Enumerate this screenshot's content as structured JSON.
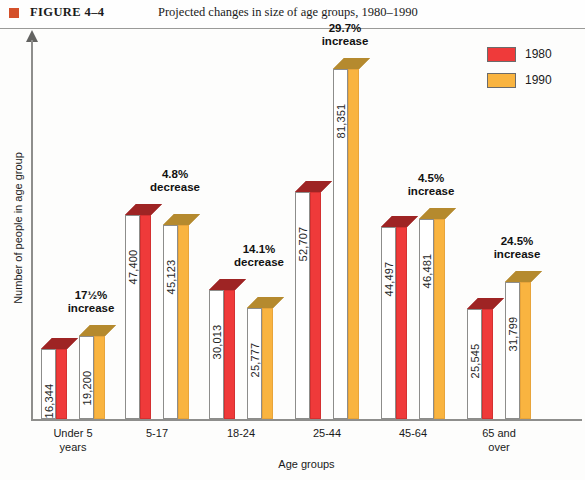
{
  "header": {
    "figure_label": "FIGURE  4–4",
    "title": "Projected changes in size of age groups, 1980–1990",
    "bullet_icon": "square-bullet-icon",
    "bullet_color": "#d4502a"
  },
  "legend": {
    "position": "top-right",
    "items": [
      {
        "label": "1980",
        "color": "#ef3a3a"
      },
      {
        "label": "1990",
        "color": "#f9b440"
      }
    ]
  },
  "axes": {
    "ylabel": "Number of people in age group",
    "xlabel": "Age groups"
  },
  "chart_data": {
    "type": "bar",
    "title": "Projected changes in size of age groups, 1980–1990",
    "xlabel": "Age groups",
    "ylabel": "Number of people in age group",
    "grid": false,
    "legend_position": "top-right",
    "ylim": [
      0,
      90000
    ],
    "categories": [
      "Under 5\nyears",
      "5-17",
      "18-24",
      "25-44",
      "45-64",
      "65 and\nover"
    ],
    "series": [
      {
        "name": "1980",
        "color": "#ef3a3a",
        "values": [
          16344,
          47400,
          30013,
          52707,
          44497,
          25545
        ],
        "value_labels": [
          "16,344",
          "47,400",
          "30,013",
          "52,707",
          "44,497",
          "25,545"
        ]
      },
      {
        "name": "1990",
        "color": "#f9b440",
        "values": [
          19200,
          45123,
          25777,
          81351,
          46481,
          31799
        ],
        "value_labels": [
          "19,200",
          "45,123",
          "25,777",
          "81,351",
          "46,481",
          "31,799"
        ]
      }
    ],
    "annotations": [
      {
        "category": "Under 5 years",
        "pct": "17½%",
        "direction": "increase"
      },
      {
        "category": "5-17",
        "pct": "4.8%",
        "direction": "decrease"
      },
      {
        "category": "18-24",
        "pct": "14.1%",
        "direction": "decrease"
      },
      {
        "category": "25-44",
        "pct": "29.7%",
        "direction": "increase"
      },
      {
        "category": "45-64",
        "pct": "4.5%",
        "direction": "increase"
      },
      {
        "category": "65 and over",
        "pct": "24.5%",
        "direction": "increase"
      }
    ]
  },
  "groups": [
    {
      "cat_line1": "Under 5",
      "cat_line2": "years",
      "pct_line1": "17½%",
      "pct_line2": "increase",
      "v1980": "16,344",
      "v1990": "19,200"
    },
    {
      "cat_line1": "5-17",
      "cat_line2": "",
      "pct_line1": "4.8%",
      "pct_line2": "decrease",
      "v1980": "47,400",
      "v1990": "45,123"
    },
    {
      "cat_line1": "18-24",
      "cat_line2": "",
      "pct_line1": "14.1%",
      "pct_line2": "decrease",
      "v1980": "30,013",
      "v1990": "25,777"
    },
    {
      "cat_line1": "25-44",
      "cat_line2": "",
      "pct_line1": "29.7%",
      "pct_line2": "increase",
      "v1980": "52,707",
      "v1990": "81,351"
    },
    {
      "cat_line1": "45-64",
      "cat_line2": "",
      "pct_line1": "4.5%",
      "pct_line2": "increase",
      "v1980": "44,497",
      "v1990": "46,481"
    },
    {
      "cat_line1": "65 and",
      "cat_line2": "over",
      "pct_line1": "24.5%",
      "pct_line2": "increase",
      "v1980": "25,545",
      "v1990": "31,799"
    }
  ]
}
